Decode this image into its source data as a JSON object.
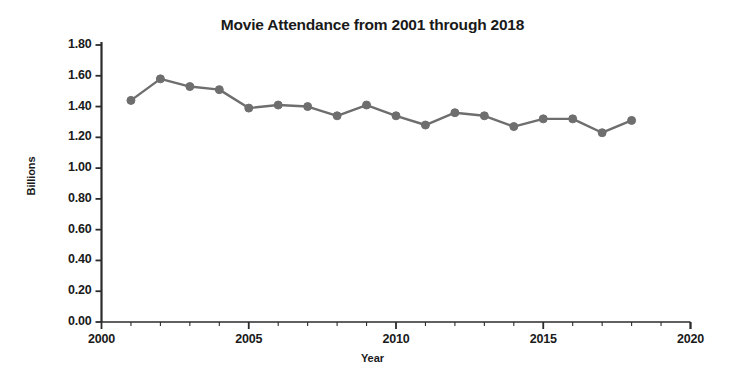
{
  "chart_data": {
    "type": "line",
    "title": "Movie Attendance from 2001 through 2018",
    "xlabel": "Year",
    "ylabel": "Billions",
    "x": [
      2001,
      2002,
      2003,
      2004,
      2005,
      2006,
      2007,
      2008,
      2009,
      2010,
      2011,
      2012,
      2013,
      2014,
      2015,
      2016,
      2017,
      2018
    ],
    "values": [
      1.44,
      1.58,
      1.53,
      1.51,
      1.39,
      1.41,
      1.4,
      1.34,
      1.41,
      1.34,
      1.28,
      1.36,
      1.34,
      1.27,
      1.32,
      1.32,
      1.23,
      1.31
    ],
    "series": [
      {
        "name": "Movie Attendance",
        "values": [
          1.44,
          1.58,
          1.53,
          1.51,
          1.39,
          1.41,
          1.4,
          1.34,
          1.41,
          1.34,
          1.28,
          1.36,
          1.34,
          1.27,
          1.32,
          1.32,
          1.23,
          1.31
        ]
      }
    ],
    "xlim": [
      2000,
      2020
    ],
    "ylim": [
      0.0,
      1.8
    ],
    "x_ticks": [
      2000,
      2005,
      2010,
      2015,
      2020
    ],
    "x_tick_labels": [
      "2000",
      "2005",
      "2010",
      "2015",
      "2020"
    ],
    "x_minor_ticks": [
      2001,
      2002,
      2003,
      2004,
      2006,
      2007,
      2008,
      2009,
      2011,
      2012,
      2013,
      2014,
      2016,
      2017,
      2018,
      2019
    ],
    "y_ticks": [
      0.0,
      0.2,
      0.4,
      0.6,
      0.8,
      1.0,
      1.2,
      1.4,
      1.6,
      1.8
    ],
    "y_tick_labels": [
      "0.00",
      "0.20",
      "0.40",
      "0.60",
      "0.80",
      "1.00",
      "1.20",
      "1.40",
      "1.60",
      "1.80"
    ],
    "grid": false,
    "legend": "none",
    "line_color": "#6e6e6e",
    "marker_color": "#6e6e6e",
    "marker_shape": "circle",
    "axis_color": "#2b2b2b",
    "background_color": "#ffffff"
  }
}
